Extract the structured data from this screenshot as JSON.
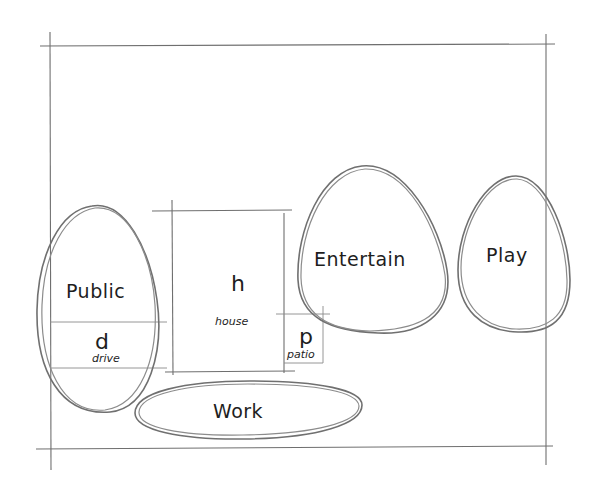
{
  "diagram": {
    "type": "bubble-diagram-site-plan",
    "zones": [
      {
        "id": "public",
        "label": "Public"
      },
      {
        "id": "entertain",
        "label": "Entertain"
      },
      {
        "id": "play",
        "label": "Play"
      },
      {
        "id": "work",
        "label": "Work"
      }
    ],
    "spaces": [
      {
        "id": "drive",
        "letter": "d",
        "label": "drive"
      },
      {
        "id": "house",
        "letter": "h",
        "label": "house"
      },
      {
        "id": "patio",
        "letter": "p",
        "label": "patio"
      }
    ]
  }
}
